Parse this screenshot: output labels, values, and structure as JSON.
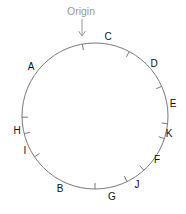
{
  "diagram": {
    "type": "circular-position-diagram",
    "origin": {
      "label": "Origin",
      "angle": -10
    },
    "circle": {
      "cx": 95,
      "cy": 116,
      "r": 73,
      "stroke": "#7a7a7a"
    },
    "colors": {
      "label": "#111111",
      "origin": "#9a9a9a",
      "circle": "#7a7a7a",
      "tick": "#7a7a7a"
    },
    "ticks_angles_deg": [
      -10,
      28,
      66,
      96,
      108,
      138,
      154,
      180,
      236,
      256,
      269
    ],
    "labels": [
      {
        "text": "C",
        "x": 108,
        "y": 40
      },
      {
        "text": "D",
        "x": 154,
        "y": 67
      },
      {
        "text": "E",
        "x": 173,
        "y": 107
      },
      {
        "text": "K",
        "x": 169,
        "y": 137
      },
      {
        "text": "F",
        "x": 157,
        "y": 163
      },
      {
        "text": "J",
        "x": 137,
        "y": 188
      },
      {
        "text": "G",
        "x": 112,
        "y": 200
      },
      {
        "text": "B",
        "x": 60,
        "y": 192
      },
      {
        "text": "I",
        "x": 25,
        "y": 154
      },
      {
        "text": "H",
        "x": 17,
        "y": 134
      },
      {
        "text": "A",
        "x": 31,
        "y": 70
      }
    ]
  }
}
